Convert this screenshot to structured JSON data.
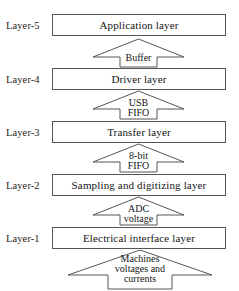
{
  "diagram": {
    "background_color": "#ffffff",
    "line_color": "#555555",
    "text_color": "#151515",
    "layers": [
      {
        "label": "Layer-5",
        "name": "Application layer"
      },
      {
        "label": "Layer-4",
        "name": "Driver layer"
      },
      {
        "label": "Layer-3",
        "name": "Transfer layer"
      },
      {
        "label": "Layer-2",
        "name": "Sampling and digitizing layer"
      },
      {
        "label": "Layer-1",
        "name": "Electrical interface layer"
      }
    ],
    "arrows": [
      {
        "id": "buffer",
        "lines": [
          "Buffer"
        ],
        "direction": "up"
      },
      {
        "id": "usb-fifo",
        "lines": [
          "USB",
          "FIFO"
        ],
        "direction": "up"
      },
      {
        "id": "8bit-fifo",
        "lines": [
          "8-bit",
          "FIFO"
        ],
        "direction": "up"
      },
      {
        "id": "adc",
        "lines": [
          "ADC",
          "voltage"
        ],
        "direction": "up"
      },
      {
        "id": "machines",
        "lines": [
          "Machines",
          "voltages and",
          "currents"
        ],
        "direction": "up"
      }
    ]
  }
}
